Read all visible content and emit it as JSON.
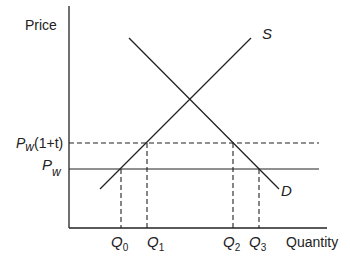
{
  "diagram": {
    "type": "supply-demand-tariff",
    "axes": {
      "y_label": "Price",
      "x_label": "Quantity"
    },
    "curves": {
      "supply": {
        "label": "S"
      },
      "demand": {
        "label": "D"
      }
    },
    "price_levels": {
      "world_price": {
        "base": "P",
        "sub": "w"
      },
      "tariff_price": {
        "base": "P",
        "sub": "w",
        "suffix": "(1+t)"
      }
    },
    "quantities": [
      {
        "base": "Q",
        "sub": "0"
      },
      {
        "base": "Q",
        "sub": "1"
      },
      {
        "base": "Q",
        "sub": "2"
      },
      {
        "base": "Q",
        "sub": "3"
      }
    ],
    "colors": {
      "line": "#222222",
      "background": "#ffffff"
    }
  }
}
